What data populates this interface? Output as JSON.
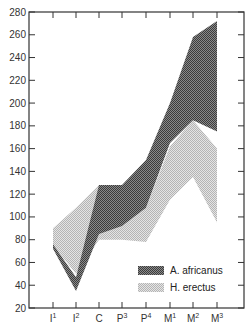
{
  "chart_data": {
    "type": "area",
    "title": "",
    "xlabel": "",
    "ylabel": "",
    "ylim": [
      20,
      280
    ],
    "yticks": [
      20,
      40,
      60,
      80,
      100,
      120,
      140,
      160,
      180,
      200,
      220,
      240,
      260,
      280
    ],
    "categories": [
      "I1",
      "I2",
      "C",
      "P3",
      "P4",
      "M1",
      "M2",
      "M3"
    ],
    "category_labels": [
      {
        "base": "I",
        "sup": "1"
      },
      {
        "base": "I",
        "sup": "2"
      },
      {
        "base": "C",
        "sup": ""
      },
      {
        "base": "P",
        "sup": "3"
      },
      {
        "base": "P",
        "sup": "4"
      },
      {
        "base": "M",
        "sup": "1"
      },
      {
        "base": "M",
        "sup": "2"
      },
      {
        "base": "M",
        "sup": "3"
      }
    ],
    "series": [
      {
        "name": "H. erectus",
        "style": "light-stipple",
        "color": "#c8c8c8",
        "min": [
          75,
          50,
          80,
          80,
          78,
          115,
          135,
          95
        ],
        "max": [
          90,
          108,
          128,
          100,
          108,
          162,
          185,
          160
        ]
      },
      {
        "name": "A. africanus",
        "style": "dark-stipple",
        "color": "#6e6e6e",
        "min": [
          72,
          35,
          85,
          92,
          108,
          165,
          185,
          175
        ],
        "max": [
          76,
          47,
          128,
          128,
          150,
          200,
          258,
          272
        ]
      }
    ],
    "legend": {
      "position": "lower-right",
      "entries": [
        "A. africanus",
        "H. erectus"
      ]
    },
    "grid": false
  }
}
